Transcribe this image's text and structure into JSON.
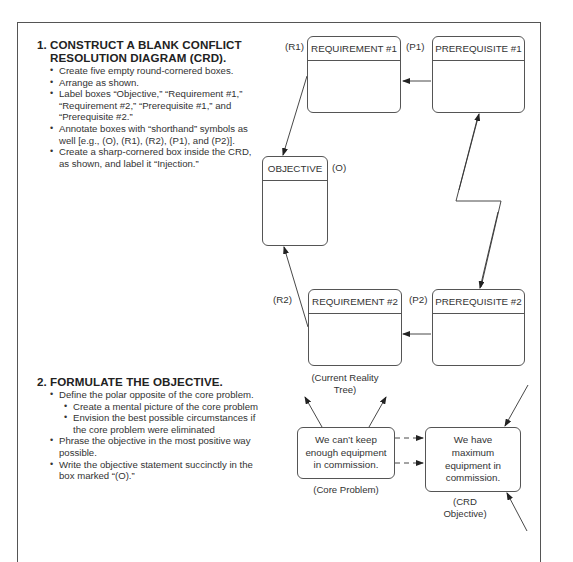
{
  "section1": {
    "number": "1.",
    "title_line1": "CONSTRUCT A BLANK CONFLICT",
    "title_line2": "RESOLUTION DIAGRAM (CRD).",
    "bullets": [
      "Create five empty round-cornered boxes.",
      "Arrange as shown.",
      "Label boxes “Objective,” “Requirement #1,” “Requirement #2,” “Prerequisite #1,” and “Prerequisite #2.”",
      "Annotate boxes with “shorthand” symbols as well [e.g., (O), (R1), (R2), (P1), and (P2)].",
      "Create a sharp-cornered box inside the CRD, as shown, and label it “Injection.”"
    ]
  },
  "section2": {
    "number": "2.",
    "title": "FORMULATE THE OBJECTIVE.",
    "bullets": [
      "Define the polar opposite of the core problem.",
      "Phrase the objective in the most positive way possible.",
      "Write the objective statement succinctly in the box marked “(O).”"
    ],
    "sub_bullets": [
      "Create a mental picture of the core problem",
      "Envision the best possible circumstances if the core problem were eliminated"
    ]
  },
  "crd": {
    "objective": {
      "label": "OBJECTIVE",
      "tag": "(O)"
    },
    "requirement1": {
      "label": "REQUIREMENT #1",
      "tag": "(R1)"
    },
    "requirement2": {
      "label": "REQUIREMENT #2",
      "tag": "(R2)"
    },
    "prerequisite1": {
      "label": "PREREQUISITE #1",
      "tag": "(P1)"
    },
    "prerequisite2": {
      "label": "PREREQUISITE #2",
      "tag": "(P2)"
    }
  },
  "example": {
    "current_reality_tree": "(Current Reality Tree)",
    "core_problem_text": "We can’t keep enough equipment in commission.",
    "core_problem_caption": "(Core Problem)",
    "objective_text": "We have maximum equipment in commission.",
    "objective_caption": "(CRD Objective)"
  }
}
